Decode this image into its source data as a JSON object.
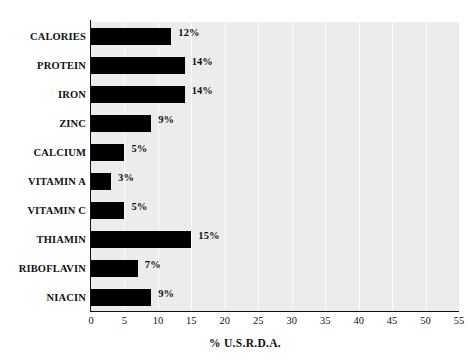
{
  "chart_data": {
    "type": "bar",
    "orientation": "horizontal",
    "title": "",
    "subtitle": "",
    "xlabel": "% U.S.R.D.A.",
    "ylabel": "",
    "categories": [
      "CALORIES",
      "PROTEIN",
      "IRON",
      "ZINC",
      "CALCIUM",
      "VITAMIN A",
      "VITAMIN C",
      "THIAMIN",
      "RIBOFLAVIN",
      "NIACIN"
    ],
    "values": [
      12,
      14,
      14,
      9,
      5,
      3,
      5,
      15,
      7,
      9
    ],
    "value_labels": [
      "12%",
      "14%",
      "14%",
      "9%",
      "5%",
      "3%",
      "5%",
      "15%",
      "7%",
      "9%"
    ],
    "xlim": [
      0,
      55
    ],
    "xticks": [
      0,
      5,
      10,
      15,
      20,
      25,
      30,
      35,
      40,
      45,
      50,
      55
    ],
    "xtick_labels": [
      "0",
      "5",
      "10",
      "15",
      "20",
      "25",
      "30",
      "35",
      "40",
      "45",
      "50",
      "55"
    ],
    "grid": true,
    "grid_axis": "x",
    "legend": false,
    "bar_color": "#000000",
    "plot_background": "#ececec",
    "gridline_color": "#fbfbfb",
    "axis_color": "#111111",
    "text_color": "#111111",
    "page_background": "#ffffff"
  }
}
